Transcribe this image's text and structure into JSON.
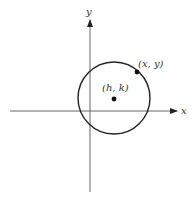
{
  "diagram": {
    "type": "circle-on-coordinate-plane",
    "axes": {
      "x_label": "x",
      "y_label": "y",
      "color": "#555555"
    },
    "circle": {
      "stroke": "#222222"
    },
    "center_point": {
      "label": "(h, k)"
    },
    "circle_point": {
      "label": "(x, y)"
    }
  }
}
